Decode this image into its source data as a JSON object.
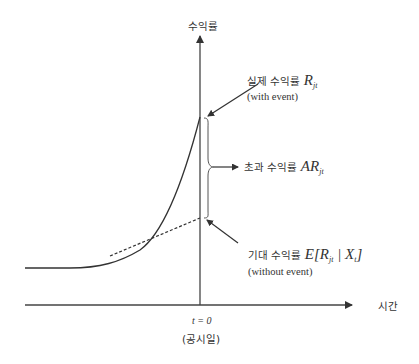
{
  "axes": {
    "y_label": "수익률",
    "x_label": "시간"
  },
  "event_time": {
    "label": "t = 0",
    "sublabel": "(공시일)"
  },
  "annotations": {
    "actual": {
      "title_ko": "실제 수익률",
      "math": "R",
      "math_sub": "jt",
      "note": "(with event)"
    },
    "abnormal": {
      "title_ko": "초과 수익률",
      "math": "AR",
      "math_sub": "jt"
    },
    "expected": {
      "title_ko": "기대 수익률",
      "math_prefix": "E[",
      "math_R": "R",
      "math_sub": "jt",
      "math_mid": " | ",
      "math_X": "X",
      "math_X_sub": "t",
      "math_suffix": "]",
      "note": "(without event)"
    }
  },
  "colors": {
    "line": "#333333",
    "axis": "#444444"
  }
}
